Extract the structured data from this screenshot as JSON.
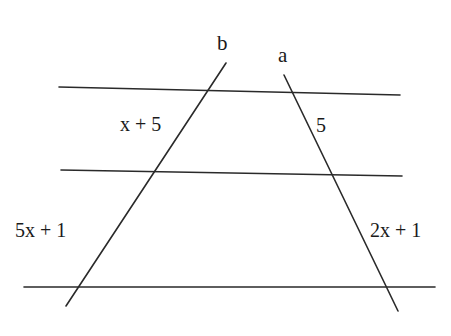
{
  "diagram": {
    "title": "",
    "colors": {
      "background": "#ffffff",
      "stroke": "#2a2a2a",
      "text": "#1a1a1a"
    },
    "parallel_lines": [
      {
        "id": "top",
        "x1": 59,
        "y1": 87,
        "x2": 400,
        "y2": 95
      },
      {
        "id": "middle",
        "x1": 61,
        "y1": 170,
        "x2": 402,
        "y2": 176
      },
      {
        "id": "bottom",
        "x1": 24,
        "y1": 287,
        "x2": 435,
        "y2": 287
      }
    ],
    "transversals": [
      {
        "id": "b",
        "label": "b",
        "x1": 226,
        "y1": 63,
        "x2": 66,
        "y2": 306,
        "label_x": 217,
        "label_y": 50
      },
      {
        "id": "a",
        "label": "a",
        "x1": 284,
        "y1": 75,
        "x2": 398,
        "y2": 311,
        "label_x": 278,
        "label_y": 62
      }
    ],
    "segment_labels": [
      {
        "id": "b-upper",
        "text": "x + 5",
        "x": 120,
        "y": 131
      },
      {
        "id": "a-upper",
        "text": "5",
        "x": 316,
        "y": 132
      },
      {
        "id": "b-lower",
        "text": "5x + 1",
        "x": 15,
        "y": 237
      },
      {
        "id": "a-lower",
        "text": "2x + 1",
        "x": 370,
        "y": 237
      }
    ]
  }
}
